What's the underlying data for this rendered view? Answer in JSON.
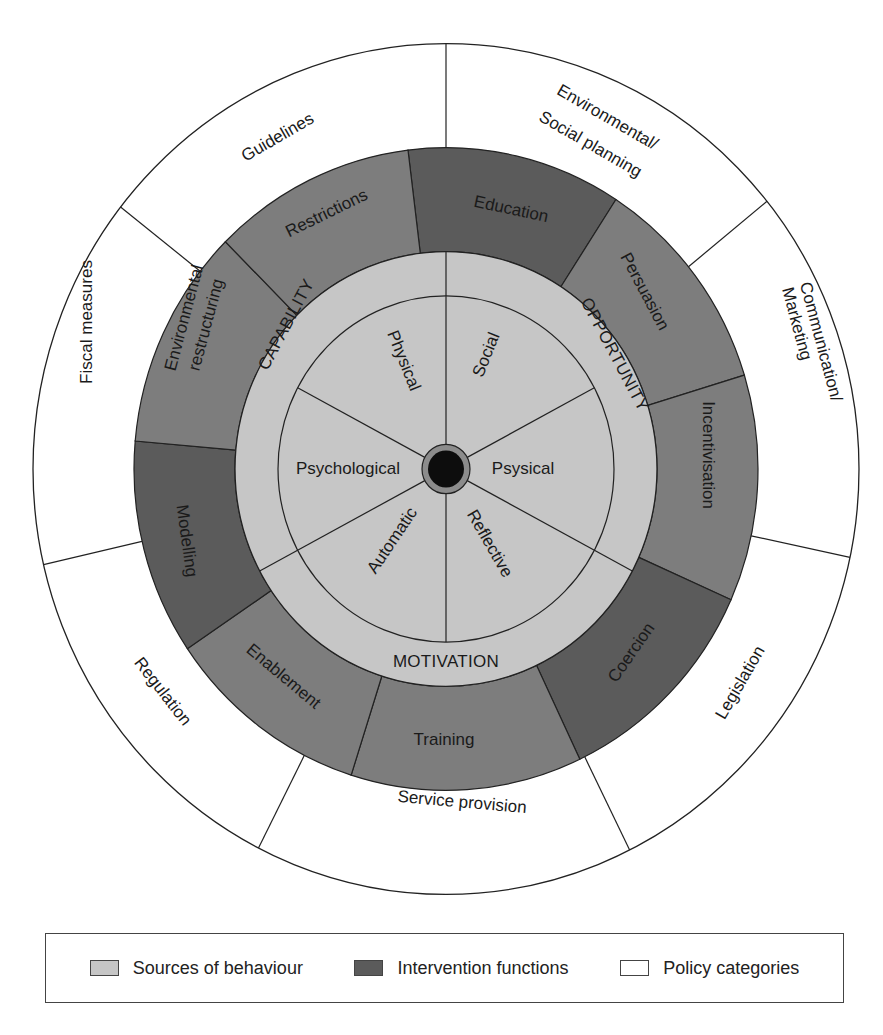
{
  "colors": {
    "sources": "#c6c6c6",
    "intervention_medium": "#7d7d7d",
    "intervention_dark": "#5b5b5b",
    "policy": "#ffffff",
    "hub_ring": "#8c8c8c",
    "hub_core": "#0d0d0d",
    "stroke": "#222222"
  },
  "policy_categories": [
    {
      "label": "Guidelines"
    },
    {
      "label_line1": "Environmental/",
      "label_line2": "Social planning"
    },
    {
      "label_line1": "Communication/",
      "label_line2": "Marketing"
    },
    {
      "label": "Legislation"
    },
    {
      "label": "Service provision"
    },
    {
      "label": "Regulation"
    },
    {
      "label": "Fiscal measures"
    }
  ],
  "intervention_functions": [
    {
      "label": "Restrictions",
      "shade": "dark"
    },
    {
      "label": "Education",
      "shade": "medium"
    },
    {
      "label": "Persuasion",
      "shade": "medium"
    },
    {
      "label": "Incentivisation",
      "shade": "dark"
    },
    {
      "label": "Coercion",
      "shade": "medium"
    },
    {
      "label": "Training",
      "shade": "medium"
    },
    {
      "label": "Enablement",
      "shade": "dark"
    },
    {
      "label": "Modelling",
      "shade": "medium"
    },
    {
      "label_line1": "Environmental",
      "label_line2": "restructuring",
      "shade": "medium"
    }
  ],
  "components": [
    {
      "label": "CAPABILITY"
    },
    {
      "label": "OPPORTUNITY"
    },
    {
      "label": "MOTIVATION"
    }
  ],
  "sources": [
    {
      "label": "Physical"
    },
    {
      "label": "Social"
    },
    {
      "label": "Psysical"
    },
    {
      "label": "Reflective"
    },
    {
      "label": "Automatic"
    },
    {
      "label": "Psychological"
    }
  ],
  "legend": {
    "items": [
      {
        "label": "Sources of behaviour",
        "color": "#c6c6c6"
      },
      {
        "label": "Intervention functions",
        "color": "#5b5b5b"
      },
      {
        "label": "Policy categories",
        "color": "#ffffff"
      }
    ]
  }
}
